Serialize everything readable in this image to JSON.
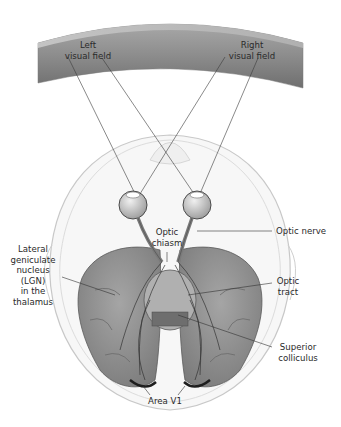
{
  "diagram": {
    "labels": {
      "left_visual_field": [
        "Left",
        "visual field"
      ],
      "right_visual_field": [
        "Right",
        "visual field"
      ],
      "optic_chiasm": [
        "Optic",
        "chiasm"
      ],
      "optic_nerve": [
        "Optic nerve"
      ],
      "lgn": [
        "Lateral",
        "geniculate",
        "nucleus",
        "(LGN)",
        "in the",
        "thalamus"
      ],
      "optic_tract": [
        "Optic",
        "tract"
      ],
      "superior_colliculus": [
        "Superior",
        "colliculus"
      ],
      "area_v1": [
        "Area V1"
      ]
    },
    "colors": {
      "visual_field_band": "#8a8a8a",
      "brain_tissue": "#8f8f8f",
      "head_outline": "#c8c8c8",
      "leader_line": "#333333",
      "text": "#2a2a2a"
    }
  }
}
